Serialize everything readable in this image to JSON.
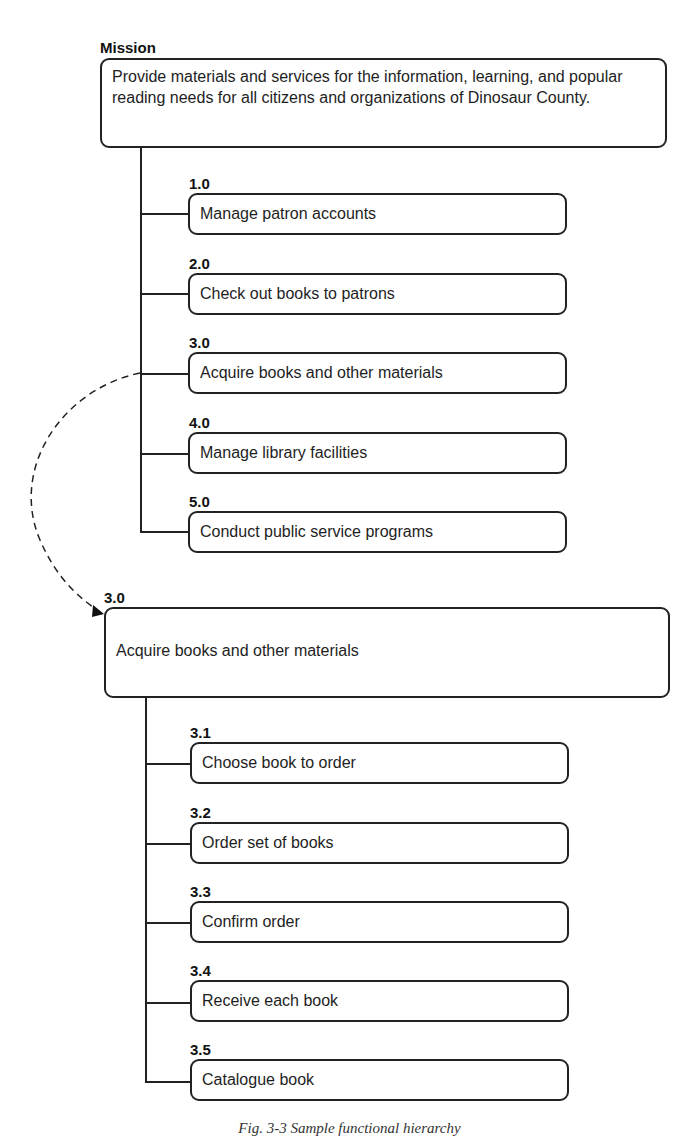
{
  "mission": {
    "label": "Mission",
    "text": "Provide materials and services for the information, learning, and popular reading needs for all citizens and organizations of Dinosaur County."
  },
  "top_functions": [
    {
      "id": "1.0",
      "text": "Manage patron accounts"
    },
    {
      "id": "2.0",
      "text": "Check out books to patrons"
    },
    {
      "id": "3.0",
      "text": "Acquire books and other materials"
    },
    {
      "id": "4.0",
      "text": "Manage library facilities"
    },
    {
      "id": "5.0",
      "text": "Conduct public service programs"
    }
  ],
  "expanded": {
    "id": "3.0",
    "text": "Acquire books and other materials",
    "sub_functions": [
      {
        "id": "3.1",
        "text": "Choose book to order"
      },
      {
        "id": "3.2",
        "text": "Order set of books"
      },
      {
        "id": "3.3",
        "text": "Confirm order"
      },
      {
        "id": "3.4",
        "text": "Receive each book"
      },
      {
        "id": "3.5",
        "text": "Catalogue book"
      }
    ]
  },
  "caption": "Fig. 3-3  Sample functional hierarchy"
}
